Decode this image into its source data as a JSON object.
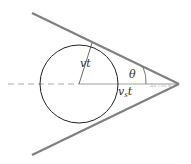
{
  "diagram": {
    "type": "mach-cone",
    "labels": {
      "radius": "vt",
      "angle": "θ",
      "source_distance_main": "v",
      "source_distance_sub": "s",
      "source_distance_tail": "t",
      "faint_tip_label": "Δx cos θ"
    },
    "colors": {
      "cone_lines": "#808080",
      "circle": "#222222",
      "axis": "#888888",
      "dashed": "#aaaaaa"
    }
  }
}
